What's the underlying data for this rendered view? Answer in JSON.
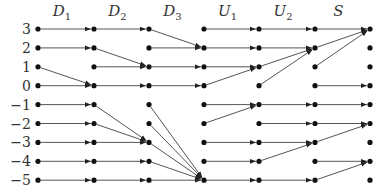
{
  "diagram": {
    "rows": [
      3,
      2,
      1,
      0,
      -1,
      -2,
      -3,
      -4,
      -5
    ],
    "row_labels": [
      "3",
      "2",
      "1",
      "0",
      "−1",
      "−2",
      "−3",
      "−4",
      "−5"
    ],
    "stages": [
      {
        "name": "D",
        "sub": "1"
      },
      {
        "name": "D",
        "sub": "2"
      },
      {
        "name": "D",
        "sub": "3"
      },
      {
        "name": "U",
        "sub": "1"
      },
      {
        "name": "U",
        "sub": "2"
      },
      {
        "name": "S",
        "sub": ""
      }
    ],
    "transitions": [
      [
        [
          3,
          3
        ],
        [
          2,
          2
        ],
        [
          1,
          0
        ],
        [
          0,
          0
        ],
        [
          -1,
          -1
        ],
        [
          -2,
          -2
        ],
        [
          -3,
          -3
        ],
        [
          -4,
          -4
        ],
        [
          -5,
          -5
        ]
      ],
      [
        [
          3,
          3
        ],
        [
          2,
          1
        ],
        [
          1,
          1
        ],
        [
          0,
          0
        ],
        [
          -1,
          -3
        ],
        [
          -2,
          -3
        ],
        [
          -3,
          -3
        ],
        [
          -4,
          -4
        ],
        [
          -5,
          -5
        ]
      ],
      [
        [
          3,
          2
        ],
        [
          2,
          2
        ],
        [
          1,
          1
        ],
        [
          0,
          0
        ],
        [
          -1,
          -5
        ],
        [
          -2,
          -5
        ],
        [
          -3,
          -5
        ],
        [
          -4,
          -5
        ],
        [
          -5,
          -5
        ]
      ],
      [
        [
          3,
          3
        ],
        [
          2,
          2
        ],
        [
          1,
          1
        ],
        [
          0,
          1
        ],
        [
          -1,
          -1
        ],
        [
          -2,
          -1
        ],
        [
          -3,
          -3
        ],
        [
          -4,
          -4
        ],
        [
          -5,
          -5
        ]
      ],
      [
        [
          3,
          3
        ],
        [
          2,
          2
        ],
        [
          1,
          2
        ],
        [
          0,
          2
        ],
        [
          -1,
          -1
        ],
        [
          -2,
          -2
        ],
        [
          -3,
          -3
        ],
        [
          -4,
          -3
        ],
        [
          -5,
          -5
        ]
      ],
      [
        [
          3,
          3
        ],
        [
          2,
          3
        ],
        [
          1,
          3
        ],
        [
          0,
          0
        ],
        [
          -1,
          -1
        ],
        [
          -2,
          -2
        ],
        [
          -3,
          -2
        ],
        [
          -4,
          -4
        ],
        [
          -5,
          -4
        ]
      ]
    ]
  }
}
